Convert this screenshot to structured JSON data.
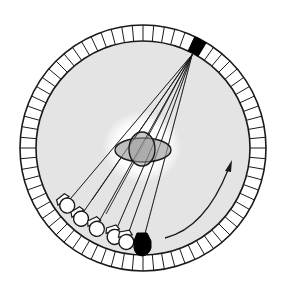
{
  "diagram": {
    "colors": {
      "background": "#ffffff",
      "gantry_fill": "#e4e4e4",
      "center_glow": "#ffffff",
      "object_fill": "#b0b0b0",
      "stroke": "#1a1a1a",
      "detector_cell": "#ffffff",
      "active_detector": "#000000",
      "source_positions_fill": "#ffffff",
      "current_source_fill": "#000000"
    },
    "ring": {
      "center": [
        143,
        148
      ],
      "outer_radius": 123,
      "inner_radius": 107,
      "segment_count": 72
    },
    "active_detector": {
      "label": "detector",
      "angle_deg": -62
    },
    "object": {
      "label": "scanned object",
      "ellipses": 2
    },
    "sources": {
      "previous_positions": 5,
      "current_position_label": "x-ray source"
    },
    "rotation_arrow": {
      "label": "rotation direction",
      "direction": "counterclockwise"
    }
  }
}
